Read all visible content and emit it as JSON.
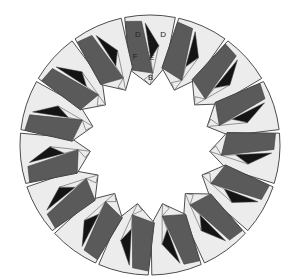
{
  "diagram": {
    "type": "tiled-ring",
    "center": [
      150,
      145
    ],
    "outer_radius": 130,
    "inner_radius": 60,
    "tile_count": 15,
    "first_tile_angle_deg": -90,
    "gap_deg": 1.6,
    "colors": {
      "background": "#ffffff",
      "light": "#ececec",
      "dark": "#5a5a5a",
      "black": "#141414",
      "outline": "#3a3a3a"
    },
    "labeled_tile_index": 0,
    "labels": [
      {
        "text": "D",
        "r": 112,
        "a": -0.55
      },
      {
        "text": "C",
        "r": 102,
        "a": 0.05
      },
      {
        "text": "D",
        "r": 112,
        "a": 0.6
      },
      {
        "text": "F",
        "r": 90,
        "a": -0.85
      },
      {
        "text": "E",
        "r": 88,
        "a": 0.1
      },
      {
        "text": "B",
        "r": 68,
        "a": 0.05
      }
    ]
  }
}
